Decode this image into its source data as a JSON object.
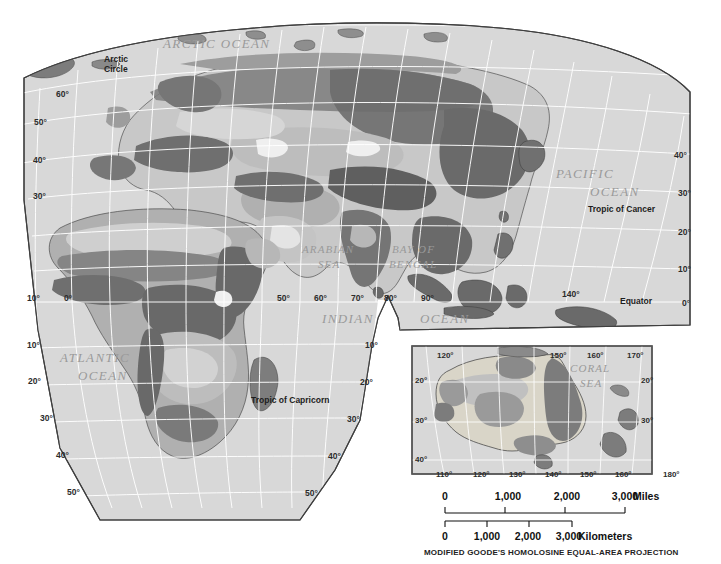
{
  "map": {
    "projection_caption": "MODIFIED GOODE'S HOMOLOSINE EQUAL-AREA PROJECTION",
    "ocean_labels": [
      {
        "id": "arctic_ocean",
        "text": "ARCTIC  OCEAN",
        "x": 163,
        "y": 48
      },
      {
        "id": "pacific_ocean_1",
        "text": "PACIFIC",
        "x": 556,
        "y": 178
      },
      {
        "id": "pacific_ocean_2",
        "text": "OCEAN",
        "x": 590,
        "y": 196
      },
      {
        "id": "arabian_sea_1",
        "text": "ARABIAN",
        "x": 302,
        "y": 253
      },
      {
        "id": "arabian_sea_2",
        "text": "SEA",
        "x": 318,
        "y": 268
      },
      {
        "id": "bay_of_bengal_1",
        "text": "BAY OF",
        "x": 392,
        "y": 253
      },
      {
        "id": "bay_of_bengal_2",
        "text": "BENGAL",
        "x": 389,
        "y": 268
      },
      {
        "id": "indian_ocean_1",
        "text": "INDIAN",
        "x": 322,
        "y": 323
      },
      {
        "id": "indian_ocean_2",
        "text": "OCEAN",
        "x": 420,
        "y": 323
      },
      {
        "id": "atlantic_ocean_1",
        "text": "ATLANTIC",
        "x": 60,
        "y": 362
      },
      {
        "id": "atlantic_ocean_2",
        "text": "OCEAN",
        "x": 78,
        "y": 380
      },
      {
        "id": "coral_sea_1",
        "text": "CORAL",
        "x": 570,
        "y": 372
      },
      {
        "id": "coral_sea_2",
        "text": "SEA",
        "x": 580,
        "y": 387
      }
    ],
    "reference_lines": [
      {
        "id": "arctic_circle_1",
        "text": "Arctic",
        "x": 104,
        "y": 62
      },
      {
        "id": "arctic_circle_2",
        "text": "Circle",
        "x": 104,
        "y": 72
      },
      {
        "id": "tropic_of_cancer",
        "text": "Tropic of Cancer",
        "x": 588,
        "y": 212
      },
      {
        "id": "equator",
        "text": "Equator",
        "x": 620,
        "y": 304
      },
      {
        "id": "tropic_of_capricorn",
        "text": "Tropic of Capricorn",
        "x": 251,
        "y": 403
      }
    ],
    "graticule_labels_main": [
      {
        "text": "60°",
        "x": 56,
        "y": 97
      },
      {
        "text": "50°",
        "x": 34,
        "y": 125
      },
      {
        "text": "40°",
        "x": 33,
        "y": 163
      },
      {
        "text": "30°",
        "x": 33,
        "y": 199
      },
      {
        "text": "10°",
        "x": 27,
        "y": 301
      },
      {
        "text": "0°",
        "x": 64,
        "y": 301
      },
      {
        "text": "50°",
        "x": 277,
        "y": 301
      },
      {
        "text": "60°",
        "x": 314,
        "y": 301
      },
      {
        "text": "70°",
        "x": 351,
        "y": 301
      },
      {
        "text": "80°",
        "x": 384,
        "y": 301
      },
      {
        "text": "90°",
        "x": 421,
        "y": 301
      },
      {
        "text": "140°",
        "x": 562,
        "y": 297
      },
      {
        "text": "40°",
        "x": 674,
        "y": 158
      },
      {
        "text": "30°",
        "x": 678,
        "y": 196
      },
      {
        "text": "20°",
        "x": 678,
        "y": 235
      },
      {
        "text": "10°",
        "x": 678,
        "y": 272
      },
      {
        "text": "0°",
        "x": 682,
        "y": 306
      },
      {
        "text": "10°",
        "x": 27,
        "y": 348
      },
      {
        "text": "20°",
        "x": 28,
        "y": 384
      },
      {
        "text": "30°",
        "x": 40,
        "y": 421
      },
      {
        "text": "40°",
        "x": 56,
        "y": 458
      },
      {
        "text": "50°",
        "x": 67,
        "y": 495
      },
      {
        "text": "10°",
        "x": 365,
        "y": 348
      },
      {
        "text": "20°",
        "x": 360,
        "y": 385
      },
      {
        "text": "30°",
        "x": 347,
        "y": 422
      },
      {
        "text": "40°",
        "x": 328,
        "y": 459
      },
      {
        "text": "50°",
        "x": 305,
        "y": 496
      }
    ],
    "graticule_labels_inset": [
      {
        "text": "120°",
        "x": 437,
        "y": 358
      },
      {
        "text": "150°",
        "x": 550,
        "y": 358
      },
      {
        "text": "160°",
        "x": 587,
        "y": 358
      },
      {
        "text": "170°",
        "x": 627,
        "y": 358
      },
      {
        "text": "20°",
        "x": 415,
        "y": 383
      },
      {
        "text": "20°",
        "x": 641,
        "y": 383
      },
      {
        "text": "30°",
        "x": 415,
        "y": 423
      },
      {
        "text": "30°",
        "x": 641,
        "y": 423
      },
      {
        "text": "40°",
        "x": 415,
        "y": 462
      },
      {
        "text": "110°",
        "x": 436,
        "y": 477
      },
      {
        "text": "120°",
        "x": 473,
        "y": 477
      },
      {
        "text": "130°",
        "x": 509,
        "y": 477
      },
      {
        "text": "140°",
        "x": 545,
        "y": 477
      },
      {
        "text": "150°",
        "x": 580,
        "y": 477
      },
      {
        "text": "160°",
        "x": 615,
        "y": 477
      },
      {
        "text": "180°",
        "x": 663,
        "y": 477
      }
    ],
    "scale_miles": {
      "unit_label": "Miles",
      "ticks": [
        "0",
        "1,000",
        "2,000",
        "3,000"
      ],
      "tick_x": [
        445,
        508,
        567,
        625
      ]
    },
    "scale_kilometers": {
      "unit_label": "Kilometers",
      "ticks": [
        "0",
        "1,000",
        "2,000",
        "3,000"
      ],
      "tick_x": [
        445,
        487,
        528,
        569
      ]
    },
    "colors": {
      "ocean": "#d8d8d8",
      "land_light": "#ececec",
      "land_midlight": "#c9c9c9",
      "land_mid": "#a6a6a6",
      "land_dark": "#7d7d7d",
      "land_darker": "#636363",
      "graticule": "#ffffff",
      "outline": "#3a3a3a",
      "border": "#555555",
      "background": "#ffffff"
    }
  }
}
